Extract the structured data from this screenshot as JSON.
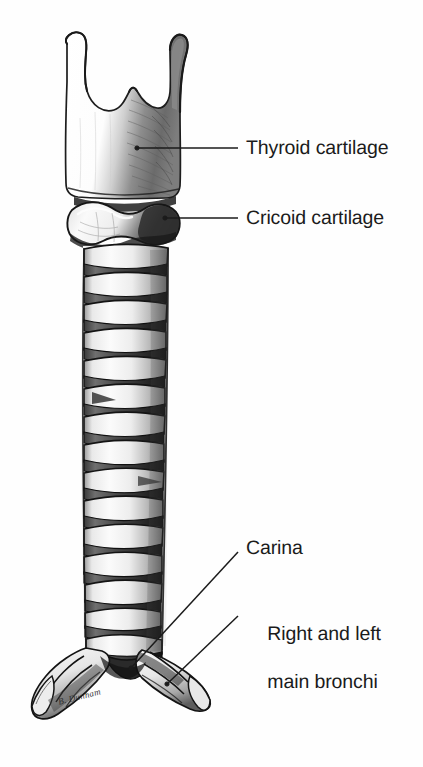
{
  "figure": {
    "kind": "anatomical-illustration",
    "medium": "pencil / graphite line drawing",
    "background_color": "#fefefe",
    "ink_color": "#1b1b1b",
    "artist_signature": "B. Dunham"
  },
  "labels": {
    "thyroid": "Thyroid cartilage",
    "cricoid": "Cricoid cartilage",
    "carina": "Carina",
    "bronchi_line1": "Right and left",
    "bronchi_line2": "main bronchi"
  },
  "callouts": [
    {
      "id": "thyroid-cartilage",
      "text": "Thyroid cartilage",
      "leader": {
        "style": "horizontal",
        "anchor_x": 137,
        "anchor_y": 148,
        "end_x": 238,
        "end_y": 148
      },
      "label_x": 246,
      "label_y": 136
    },
    {
      "id": "cricoid-cartilage",
      "text": "Cricoid cartilage",
      "leader": {
        "style": "horizontal",
        "anchor_x": 165,
        "anchor_y": 218,
        "end_x": 238,
        "end_y": 218
      },
      "label_x": 246,
      "label_y": 206
    },
    {
      "id": "carina",
      "text": "Carina",
      "leader": {
        "style": "diagonal",
        "anchor_x": 163,
        "anchor_y": 648,
        "end_x": 238,
        "end_y": 552
      },
      "label_x": 246,
      "label_y": 536
    },
    {
      "id": "main-bronchi",
      "text": "Right and left main bronchi",
      "leader": {
        "style": "diagonal",
        "anchor_x": 183,
        "anchor_y": 672,
        "end_x": 238,
        "end_y": 616
      },
      "label_x": 246,
      "label_y": 598
    }
  ],
  "structures": {
    "thyroid_cartilage": {
      "name": "Thyroid cartilage",
      "superior_horns": 2,
      "has_thyroid_notch": true,
      "top_y": 30,
      "bottom_y": 196,
      "left_x": 62,
      "right_x": 186,
      "shading": "right lamina hatched dark"
    },
    "cricoid_cartilage": {
      "name": "Cricoid cartilage",
      "top_y": 196,
      "bottom_y": 244,
      "shape": "signet ring"
    },
    "trachea": {
      "name": "Trachea",
      "ring_count": 16,
      "first_ring_y": 248,
      "ring_spacing": 28.5,
      "top_width": 86,
      "bottom_width": 74,
      "center_x_top": 126,
      "center_x_bottom": 121,
      "bifurcation_y": 645
    },
    "bronchi": {
      "name": "Right and left main bronchi",
      "left_tip_x": 36,
      "left_tip_y": 712,
      "right_tip_x": 212,
      "right_tip_y": 700,
      "ring_count_each": 3
    }
  }
}
